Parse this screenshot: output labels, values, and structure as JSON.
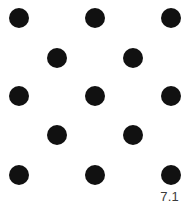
{
  "figure": {
    "label": "7.1",
    "background_color": "#ffffff",
    "dot_color": "#111111",
    "label_color": "#3b3b3b",
    "width": 182,
    "height": 209
  },
  "chart_data": {
    "type": "scatter",
    "title": "",
    "subtitle": "",
    "xlabel": "",
    "ylabel": "",
    "annotations": [
      "7.1"
    ],
    "legend": [],
    "legend_position": "none",
    "grid": false,
    "axes_visible": false,
    "tick_labels_x": [],
    "tick_labels_y": [],
    "xlim": [
      0,
      182
    ],
    "ylim": [
      209,
      0
    ],
    "marker": "circle",
    "marker_radius": 10,
    "marker_color": "#111111",
    "rows": [
      {
        "name": "row-1",
        "y": 18,
        "x": [
          19,
          95,
          171
        ]
      },
      {
        "name": "row-2",
        "y": 58,
        "x": [
          57,
          133
        ]
      },
      {
        "name": "row-3",
        "y": 96,
        "x": [
          19,
          95,
          171
        ]
      },
      {
        "name": "row-4",
        "y": 135,
        "x": [
          57,
          133
        ]
      },
      {
        "name": "row-5",
        "y": 175,
        "x": [
          19,
          95,
          171
        ]
      }
    ],
    "points": [
      {
        "x": 19,
        "y": 18
      },
      {
        "x": 95,
        "y": 18
      },
      {
        "x": 171,
        "y": 18
      },
      {
        "x": 57,
        "y": 58
      },
      {
        "x": 133,
        "y": 58
      },
      {
        "x": 19,
        "y": 96
      },
      {
        "x": 95,
        "y": 96
      },
      {
        "x": 171,
        "y": 96
      },
      {
        "x": 57,
        "y": 135
      },
      {
        "x": 133,
        "y": 135
      },
      {
        "x": 19,
        "y": 175
      },
      {
        "x": 95,
        "y": 175
      },
      {
        "x": 171,
        "y": 175
      }
    ],
    "point_count": 13
  }
}
